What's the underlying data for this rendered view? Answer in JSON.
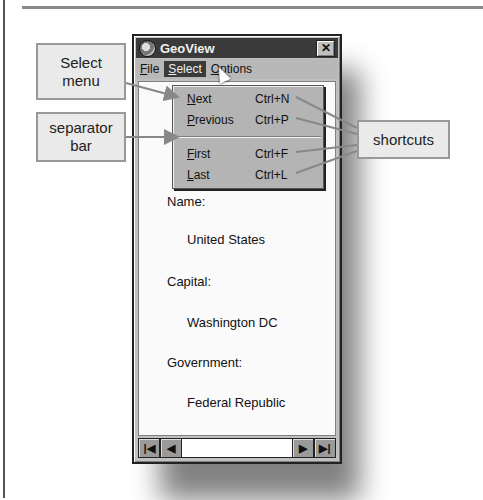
{
  "window": {
    "title": "GeoView",
    "close_label": "✕"
  },
  "menubar": {
    "items": [
      {
        "label": "File",
        "mnemonic": "F"
      },
      {
        "label": "Select",
        "mnemonic": "S"
      },
      {
        "label": "Options",
        "mnemonic": "O"
      }
    ],
    "active": "Select"
  },
  "select_menu": {
    "items": [
      {
        "label": "Next",
        "shortcut": "Ctrl+N"
      },
      {
        "label": "Previous",
        "shortcut": "Ctrl+P"
      },
      {
        "label": "First",
        "shortcut": "Ctrl+F"
      },
      {
        "label": "Last",
        "shortcut": "Ctrl+L"
      }
    ]
  },
  "record": {
    "name_label": "Name:",
    "name_value": "United States",
    "capital_label": "Capital:",
    "capital_value": "Washington DC",
    "government_label": "Government:",
    "government_value": "Federal Republic"
  },
  "navigation": {
    "first_icon": "first-record-icon",
    "prev_icon": "prev-record-icon",
    "next_icon": "next-record-icon",
    "last_icon": "last-record-icon"
  },
  "callouts": {
    "select_menu": "Select menu",
    "separator_bar": "separator bar",
    "shortcuts": "shortcuts"
  },
  "colors": {
    "title_bar": "#3a3a3a",
    "menu_bg": "#b4b4b4",
    "callout_bg": "#eaeaea"
  }
}
